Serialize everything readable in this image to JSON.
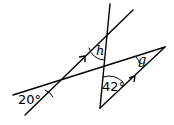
{
  "diagram": {
    "labels": {
      "angle_20": "20°",
      "angle_h": "h",
      "angle_g": "g",
      "angle_42": "42°"
    },
    "colors": {
      "stroke": "#000000",
      "background": "#ffffff"
    }
  }
}
